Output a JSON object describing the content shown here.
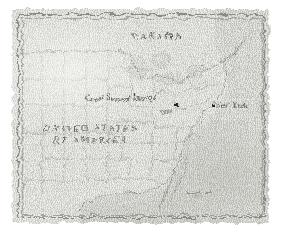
{
  "figure": {
    "name": "antique-map-eastern-united-states",
    "kind": "map"
  },
  "colors": {
    "paper": "#d9d9d4",
    "ink": "#4a4a46",
    "ocean": "#c7c7c2",
    "border_rule": "#7c7c78",
    "marker": "#26262a"
  },
  "labels": {
    "canada": "CANADA",
    "usa_line1": "UNITED STATES",
    "usa_line2": "OF AMERICA",
    "great_serpent_mound": "Great Serpent Mound",
    "ohio": "Ohio",
    "new_york": "New York"
  },
  "markers": [
    {
      "id": "great-serpent-mound",
      "label": "Great Serpent Mound",
      "x": 162,
      "y": 94
    },
    {
      "id": "new-york",
      "label": "New York",
      "x": 199,
      "y": 95
    }
  ],
  "scale_bar": {
    "text": "200 mi"
  },
  "water_bodies": {
    "atlantic": "Atlantic Ocean",
    "gulf": "Gulf of Mexico",
    "great_lakes": "Great Lakes"
  }
}
